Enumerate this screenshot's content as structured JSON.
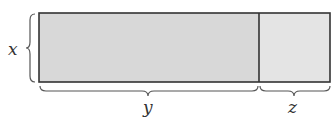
{
  "diagram": {
    "type": "area-model rectangle",
    "labels": {
      "height": "x",
      "width_left": "y",
      "width_right": "z"
    },
    "colors": {
      "left_fill": "#d9d9d9",
      "right_fill": "#e6e6e6",
      "stroke": "#333333",
      "brace": "#555555"
    }
  }
}
